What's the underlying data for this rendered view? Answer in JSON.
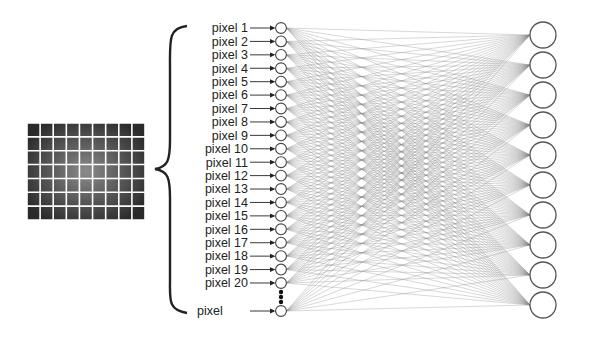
{
  "diagram": {
    "title": "",
    "image_grid": {
      "rows": 7,
      "cols": 9,
      "description": "pixelated input image"
    },
    "input_labels": [
      "pixel 1",
      "pixel 2",
      "pixel 3",
      "pixel 4",
      "pixel 5",
      "pixel 6",
      "pixel 7",
      "pixel 8",
      "pixel 9",
      "pixel 10",
      "pixel 11",
      "pixel 12",
      "pixel 13",
      "pixel 14",
      "pixel 15",
      "pixel 16",
      "pixel 17",
      "pixel 18",
      "pixel 19",
      "pixel 20"
    ],
    "last_input_label": "pixel",
    "ellipsis": "⋮",
    "input_neuron_count_shown": 21,
    "output_neuron_count": 10,
    "connection": "fully-connected",
    "colors": {
      "line": "#8a8a8a",
      "node_stroke": "#555555",
      "grid_dark": "#2a2a2a",
      "grid_light": "#8c8c8c"
    }
  }
}
